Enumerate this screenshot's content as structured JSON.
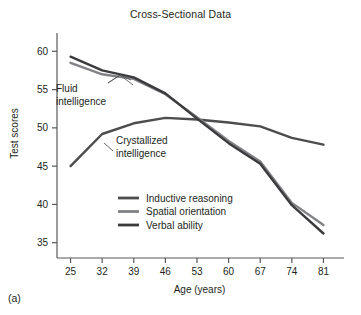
{
  "figure": {
    "panel_label": "(a)",
    "title": "Cross-Sectional Data"
  },
  "chart_data": {
    "type": "line",
    "title": "Cross-Sectional Data",
    "xlabel": "Age (years)",
    "ylabel": "Test scores",
    "x": [
      25,
      32,
      39,
      46,
      53,
      60,
      67,
      74,
      81
    ],
    "xticklabels": [
      "25",
      "32",
      "39",
      "46",
      "53",
      "60",
      "67",
      "74",
      "81"
    ],
    "yticks": [
      35,
      40,
      45,
      50,
      55,
      60
    ],
    "yticklabels": [
      "35",
      "40",
      "45",
      "50",
      "55",
      "60"
    ],
    "xlim": [
      22,
      84
    ],
    "ylim": [
      33,
      62
    ],
    "grid": false,
    "legend_position": "center",
    "series": [
      {
        "name": "Inductive reasoning",
        "color": "#4d4d4f",
        "values": [
          45.0,
          49.2,
          50.6,
          51.3,
          51.1,
          50.7,
          50.2,
          48.7,
          47.8
        ]
      },
      {
        "name": "Spatial orientation",
        "color": "#808285",
        "values": [
          58.5,
          57.0,
          56.4,
          54.4,
          51.4,
          48.3,
          45.6,
          40.2,
          37.3
        ]
      },
      {
        "name": "Verbal ability",
        "color": "#3b3b3d",
        "values": [
          59.3,
          57.5,
          56.6,
          54.5,
          51.2,
          48.0,
          45.3,
          39.9,
          36.2
        ]
      }
    ],
    "annotations": [
      {
        "name": "fluid-intelligence",
        "line1": "Fluid",
        "line2": "intelligence",
        "points_to": [
          "Spatial orientation",
          "Verbal ability"
        ]
      },
      {
        "name": "crystallized-intelligence",
        "line1": "Crystallized",
        "line2": "intelligence",
        "points_to": [
          "Inductive reasoning"
        ]
      }
    ]
  },
  "legend": {
    "entries": [
      {
        "label": "Inductive reasoning",
        "color": "#4d4d4f"
      },
      {
        "label": "Spatial orientation",
        "color": "#808285"
      },
      {
        "label": "Verbal ability",
        "color": "#3b3b3d"
      }
    ]
  },
  "axis": {
    "spine_color": "#58595b"
  }
}
